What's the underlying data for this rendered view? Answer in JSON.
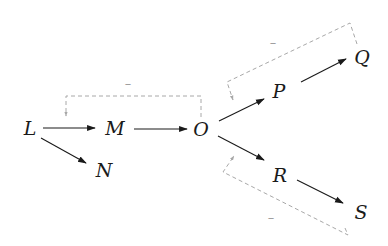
{
  "diagram": {
    "nodes": [
      {
        "id": "L",
        "label": "L"
      },
      {
        "id": "M",
        "label": "M"
      },
      {
        "id": "N",
        "label": "N"
      },
      {
        "id": "O",
        "label": "O"
      },
      {
        "id": "P",
        "label": "P"
      },
      {
        "id": "Q",
        "label": "Q"
      },
      {
        "id": "R",
        "label": "R"
      },
      {
        "id": "S",
        "label": "S"
      }
    ],
    "edges": [
      {
        "from": "L",
        "to": "M",
        "style": "solid"
      },
      {
        "from": "L",
        "to": "N",
        "style": "solid"
      },
      {
        "from": "M",
        "to": "O",
        "style": "solid"
      },
      {
        "from": "O",
        "to": "P",
        "style": "solid"
      },
      {
        "from": "O",
        "to": "R",
        "style": "solid"
      },
      {
        "from": "P",
        "to": "Q",
        "style": "solid"
      },
      {
        "from": "R",
        "to": "S",
        "style": "solid"
      }
    ],
    "feedback": [
      {
        "from": "O",
        "to": "L-M edge",
        "sign": "–",
        "style": "dashed"
      },
      {
        "from": "Q",
        "to": "O-P edge",
        "sign": "–",
        "style": "dashed"
      },
      {
        "from": "S",
        "to": "O-R edge",
        "sign": "–",
        "style": "dashed"
      }
    ],
    "colors": {
      "edge": "#1a1a1a",
      "feedback": "#a8a8a8"
    }
  }
}
